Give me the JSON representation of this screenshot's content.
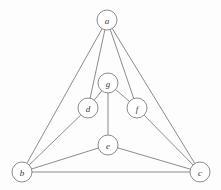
{
  "figure": {
    "kind": "undirected-graph-drawing",
    "width": 221,
    "height": 190,
    "background_color": "#fdfdfd",
    "stroke_color": "#6e6e6e",
    "node_fill_color": "#ffffff",
    "label_color": "#3a3a3a",
    "node_radius": 10,
    "vertex_count": "7",
    "edge_count": "12"
  },
  "nodes": [
    {
      "id": "a",
      "label": "a",
      "x": 107,
      "y": 20
    },
    {
      "id": "g",
      "label": "g",
      "x": 108,
      "y": 83
    },
    {
      "id": "d",
      "label": "d",
      "x": 88,
      "y": 108
    },
    {
      "id": "f",
      "label": "f",
      "x": 137,
      "y": 108
    },
    {
      "id": "e",
      "label": "e",
      "x": 108,
      "y": 145
    },
    {
      "id": "b",
      "label": "b",
      "x": 22,
      "y": 172
    },
    {
      "id": "c",
      "label": "c",
      "x": 200,
      "y": 172
    }
  ],
  "edges": [
    {
      "from": "a",
      "to": "b"
    },
    {
      "from": "a",
      "to": "c"
    },
    {
      "from": "a",
      "to": "d"
    },
    {
      "from": "a",
      "to": "f"
    },
    {
      "from": "b",
      "to": "c"
    },
    {
      "from": "b",
      "to": "d"
    },
    {
      "from": "b",
      "to": "e"
    },
    {
      "from": "c",
      "to": "e"
    },
    {
      "from": "c",
      "to": "f"
    },
    {
      "from": "d",
      "to": "g"
    },
    {
      "from": "e",
      "to": "g"
    },
    {
      "from": "f",
      "to": "g"
    }
  ]
}
